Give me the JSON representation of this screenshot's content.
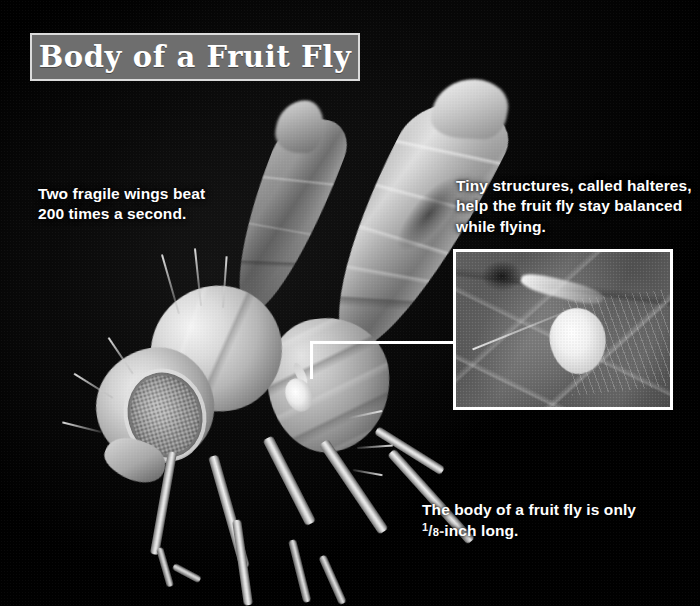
{
  "title": {
    "text": "Body of a Fruit Fly",
    "plate_bg": "#6e6e6e",
    "plate_border": "#dcdcdc",
    "text_color": "#ffffff"
  },
  "background_color": "#000000",
  "captions": {
    "wings": "Two fragile wings beat 200 times a second.",
    "halteres": "Tiny structures, called halteres, help the fruit fly stay balanced while flying.",
    "size_prefix": "The body of a fruit fly is only ",
    "size_fraction_numerator": "1",
    "size_fraction_slash": "/",
    "size_fraction_denominator": "8",
    "size_suffix": "-inch long."
  },
  "inset": {
    "label": "halteres close-up",
    "border_color": "#ffffff"
  },
  "leader": {
    "color": "#ffffff",
    "description": "bracket line connecting the halteres on the fly body to the inset photo"
  },
  "icons": {
    "fly": "fly-specimen-icon",
    "halter": "halter-icon"
  }
}
